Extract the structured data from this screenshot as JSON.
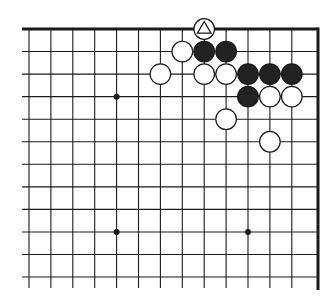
{
  "diagram": {
    "type": "go-board-fragment",
    "visible_corner": "top-right",
    "grid": {
      "cols": 14,
      "rows": 12,
      "x0": 29,
      "dx": 21.9,
      "y0": 29,
      "dy": 22.55,
      "right_edge_x": 318,
      "line_bottom_y": 288,
      "line_left_x": 22
    },
    "hoshi": [
      {
        "col": 4,
        "row": 3
      },
      {
        "col": 4,
        "row": 9
      },
      {
        "col": 10,
        "row": 9
      }
    ],
    "stones": [
      {
        "color": "white",
        "col": 8,
        "row": 0,
        "mark": "triangle"
      },
      {
        "color": "white",
        "col": 7,
        "row": 1
      },
      {
        "color": "black",
        "col": 8,
        "row": 1
      },
      {
        "color": "black",
        "col": 9,
        "row": 1
      },
      {
        "color": "white",
        "col": 6,
        "row": 2
      },
      {
        "color": "white",
        "col": 8,
        "row": 2
      },
      {
        "color": "white",
        "col": 9,
        "row": 2
      },
      {
        "color": "black",
        "col": 10,
        "row": 2
      },
      {
        "color": "black",
        "col": 11,
        "row": 2
      },
      {
        "color": "black",
        "col": 12,
        "row": 2
      },
      {
        "color": "black",
        "col": 10,
        "row": 3
      },
      {
        "color": "white",
        "col": 11,
        "row": 3
      },
      {
        "color": "white",
        "col": 12,
        "row": 3
      },
      {
        "color": "white",
        "col": 9,
        "row": 4
      },
      {
        "color": "white",
        "col": 11,
        "row": 5
      }
    ],
    "colors": {
      "line": "#1a1a1a",
      "black_stone": "#222222",
      "white_stone": "#ffffff",
      "background": "#ffffff"
    }
  }
}
